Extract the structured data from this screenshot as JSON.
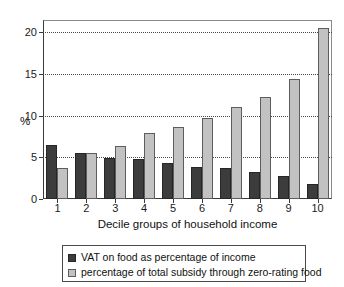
{
  "chart_data": {
    "type": "bar",
    "title": "",
    "subtitle": "",
    "xlabel": "Decile groups of household income",
    "ylabel": "%",
    "categories": [
      "1",
      "2",
      "3",
      "4",
      "5",
      "6",
      "7",
      "8",
      "9",
      "10"
    ],
    "series": [
      {
        "name": "VAT on food as percentage of income",
        "color": "#3c3c3c",
        "values": [
          6.5,
          5.5,
          4.9,
          4.8,
          4.3,
          3.9,
          3.7,
          3.2,
          2.8,
          1.8
        ]
      },
      {
        "name": "percentage of total subsidy through zero-rating food",
        "color": "#c2c2c2",
        "values": [
          3.7,
          5.5,
          6.4,
          7.9,
          8.7,
          9.7,
          11.1,
          12.3,
          14.4,
          20.6
        ]
      }
    ],
    "ylim": [
      0,
      21.5
    ],
    "yticks": [
      0,
      5,
      10,
      15,
      20
    ],
    "ytick_labels": [
      "0",
      "5",
      "10",
      "15",
      "20"
    ],
    "grid": true,
    "grid_axis": "y",
    "legend_position": "bottom",
    "legend_entries": [
      "VAT on food as percentage of income",
      "percentage of total subsidy through zero-rating food"
    ]
  }
}
